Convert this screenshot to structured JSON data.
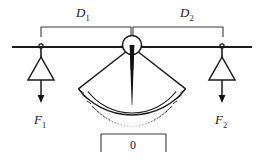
{
  "figure": {
    "background_color": "#ffffff",
    "ink_color": "#1a1a1a",
    "width": 263,
    "height": 160
  },
  "labels": {
    "distance_left": {
      "base": "D",
      "subscript": "1",
      "full": "D1",
      "x": 76,
      "y": 16
    },
    "distance_right": {
      "base": "D",
      "subscript": "2",
      "full": "D2",
      "x": 180,
      "y": 16
    },
    "force_left": {
      "base": "F",
      "subscript": "1",
      "full": "F1",
      "x": 36,
      "y": 123
    },
    "force_right": {
      "base": "F",
      "subscript": "2",
      "full": "F2",
      "x": 217,
      "y": 123
    },
    "gauge_reading": {
      "value": "0",
      "x": 133,
      "y": 149
    }
  },
  "beam": {
    "x_start": 12,
    "x_end": 252,
    "y": 47,
    "pivot_x": 132
  },
  "pivot": {
    "center_x": 132,
    "center_y": 45,
    "radius": 9.5,
    "needle_tip_y": 105
  },
  "protractor": {
    "center_x": 132,
    "center_y": 47,
    "inner_radius": 56,
    "outer_radius": 68,
    "half_angle_deg": 52,
    "tick_count": 25,
    "major_tick_every": 4
  },
  "weights": [
    {
      "name": "weight-left",
      "hanger_x": 41,
      "hanger_y": 47,
      "apex_y": 57,
      "base_y": 80,
      "half_width": 13,
      "arrow_top_y": 85,
      "arrow_bottom_y": 102
    },
    {
      "name": "weight-right",
      "hanger_x": 222,
      "hanger_y": 47,
      "apex_y": 57,
      "base_y": 80,
      "half_width": 13,
      "arrow_top_y": 85,
      "arrow_bottom_y": 102
    }
  ],
  "brackets": {
    "top_left": {
      "x_start": 41,
      "x_end": 131,
      "y": 27,
      "tick_length": 10,
      "direction": "down"
    },
    "top_right": {
      "x_start": 133,
      "x_end": 223,
      "y": 27,
      "tick_length": 10,
      "direction": "down"
    },
    "bottom_center": {
      "x_start": 101,
      "x_end": 166,
      "y": 134,
      "tick_length": 14,
      "direction": "down"
    }
  }
}
